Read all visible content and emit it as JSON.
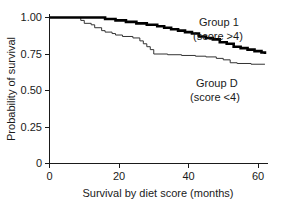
{
  "chart_data": {
    "type": "line",
    "title": "",
    "subtitle": "",
    "xlabel": "Survival by diet score (months)",
    "ylabel": "Probability of survival",
    "xlim": [
      0,
      62
    ],
    "ylim": [
      0,
      1.0
    ],
    "xticks": [
      0,
      20,
      40,
      60
    ],
    "xticklabels": [
      "0",
      "20",
      "40",
      "60"
    ],
    "yticks": [
      0,
      0.25,
      0.5,
      0.75,
      1.0
    ],
    "yticklabels": [
      "0",
      "0.25",
      "0.50",
      "0.75",
      "1.00"
    ],
    "grid": false,
    "legend_position": "inline-right",
    "step_type": "post",
    "series": [
      {
        "name": "Group 1",
        "note": "(score >4)",
        "style": "bold",
        "color": "#000000",
        "x": [
          0,
          14,
          16,
          19,
          22,
          25,
          28,
          31,
          33,
          35,
          37,
          39,
          41,
          43,
          45,
          47,
          49,
          51,
          53,
          55,
          57,
          59,
          61,
          62
        ],
        "y": [
          1.0,
          1.0,
          0.99,
          0.98,
          0.97,
          0.96,
          0.95,
          0.94,
          0.93,
          0.92,
          0.91,
          0.9,
          0.89,
          0.87,
          0.86,
          0.85,
          0.83,
          0.82,
          0.8,
          0.79,
          0.78,
          0.77,
          0.76,
          0.75
        ]
      },
      {
        "name": "Group D",
        "note": "(score <4)",
        "style": "thin",
        "color": "#333333",
        "x": [
          0,
          7,
          9,
          10,
          12,
          13,
          15,
          16,
          18,
          19,
          21,
          24,
          26,
          27,
          28,
          29,
          30,
          34,
          38,
          42,
          45,
          48,
          50,
          52,
          54,
          58,
          62
        ],
        "y": [
          1.0,
          1.0,
          0.98,
          0.96,
          0.95,
          0.93,
          0.91,
          0.9,
          0.89,
          0.88,
          0.87,
          0.86,
          0.84,
          0.82,
          0.8,
          0.78,
          0.75,
          0.745,
          0.74,
          0.735,
          0.73,
          0.72,
          0.71,
          0.69,
          0.685,
          0.68,
          0.68
        ]
      }
    ],
    "legend_labels": [
      {
        "name": "Group 1",
        "note": "(score >4)"
      },
      {
        "name": "Group D",
        "note": "(score <4)"
      }
    ]
  },
  "axes": {
    "y_label": "Probability of survival",
    "x_label": "Survival by diet score (months)",
    "y_tick_1": "1.00",
    "y_tick_2": "0.75",
    "y_tick_3": "0.50",
    "y_tick_4": "0.25",
    "y_tick_5": "0",
    "x_tick_1": "0",
    "x_tick_2": "20",
    "x_tick_3": "40",
    "x_tick_4": "60"
  },
  "legend": {
    "group1_name": "Group 1",
    "group1_note": "(score >4)",
    "groupd_name": "Group D",
    "groupd_note": "(score <4)"
  }
}
